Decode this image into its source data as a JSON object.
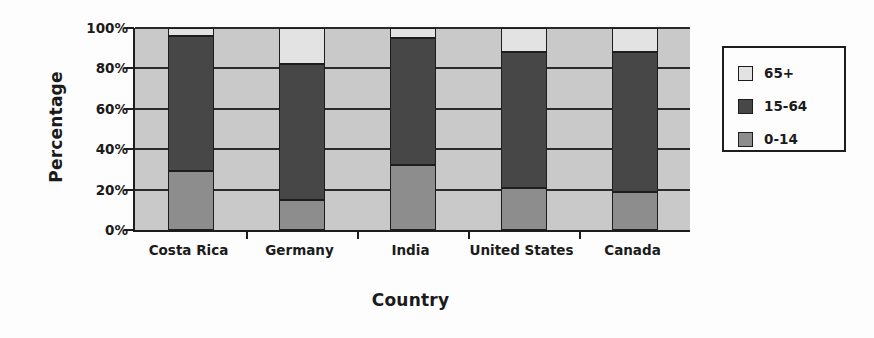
{
  "chart_data": {
    "type": "bar",
    "subtype": "stacked-bar-100-percent",
    "title": "",
    "xlabel": "Country",
    "ylabel": "Percentage",
    "categories": [
      "Costa Rica",
      "Germany",
      "India",
      "United States",
      "Canada"
    ],
    "series": [
      {
        "name": "0-14",
        "values": [
          29,
          15,
          32,
          21,
          19
        ],
        "color": "#8d8d8d"
      },
      {
        "name": "15-64",
        "values": [
          67,
          67,
          63,
          67,
          69
        ],
        "color": "#474747"
      },
      {
        "name": "65+",
        "values": [
          4,
          18,
          5,
          12,
          12
        ],
        "color": "#e3e3e3"
      }
    ],
    "cumulative_tops": {
      "0-14": [
        29,
        15,
        32,
        21,
        19
      ],
      "15-64": [
        96,
        82,
        95,
        88,
        88
      ],
      "65+": [
        100,
        100,
        100,
        100,
        100
      ]
    },
    "ylim": [
      0,
      100
    ],
    "yticks": [
      0,
      20,
      40,
      60,
      80,
      100
    ],
    "ytick_labels": [
      "0%",
      "20%",
      "40%",
      "60%",
      "80%",
      "100%"
    ],
    "grid": true,
    "grid_axis": "y",
    "legend_position": "right",
    "legend_entries": [
      "65+",
      "15-64",
      "0-14"
    ],
    "plot_background": "#c9c9c9",
    "figure_background": "#fdfdfd",
    "axis_color": "#1d1d1d"
  },
  "axes": {
    "y_title": "Percentage",
    "x_title": "Country"
  },
  "legend": {
    "items": [
      {
        "label": "65+",
        "color": "#e3e3e3"
      },
      {
        "label": "15-64",
        "color": "#474747"
      },
      {
        "label": "0-14",
        "color": "#8d8d8d"
      }
    ]
  }
}
